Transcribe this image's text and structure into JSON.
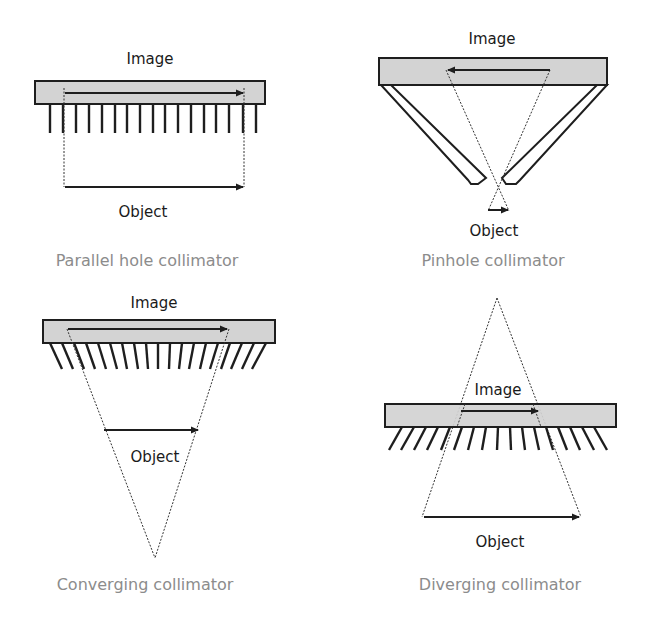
{
  "panels": [
    {
      "id": "parallel",
      "image_label": "Image",
      "object_label": "Object",
      "caption": "Parallel hole collimator"
    },
    {
      "id": "pinhole",
      "image_label": "Image",
      "object_label": "Object",
      "caption": "Pinhole collimator"
    },
    {
      "id": "converging",
      "image_label": "Image",
      "object_label": "Object",
      "caption": "Converging collimator"
    },
    {
      "id": "diverging",
      "image_label": "Image",
      "object_label": "Object",
      "caption": "Diverging collimator"
    }
  ],
  "colors": {
    "detector_fill": "#d3d3d3",
    "line": "#1e1e1e",
    "caption_text": "#8c8c8c",
    "label_text": "#1a1a1a"
  }
}
